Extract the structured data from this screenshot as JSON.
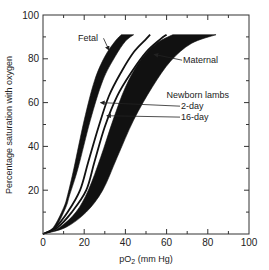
{
  "chart_data": {
    "type": "line",
    "title": "",
    "xlabel": "pO2 (mm Hg)",
    "xlabel_main": "pO",
    "xlabel_sub": "2",
    "xlabel_unit": " (mm Hg)",
    "ylabel": "Percentage saturation with oxygen",
    "xlim": [
      0,
      100
    ],
    "ylim": [
      0,
      100
    ],
    "x_ticks": [
      0,
      20,
      40,
      60,
      80,
      100
    ],
    "x_tick_labels": [
      "0",
      "20",
      "40",
      "60",
      "80",
      "100"
    ],
    "y_ticks": [
      0,
      20,
      40,
      60,
      80,
      100
    ],
    "y_tick_labels": [
      "",
      "20",
      "40",
      "60",
      "80",
      "100"
    ],
    "origin_label": "0",
    "minor_ticks": true,
    "grid": false,
    "legend": "inline annotations with arrows",
    "series": [
      {
        "name": "Fetal",
        "style": "filled band",
        "lower_edge": {
          "x": [
            0,
            5,
            10,
            12,
            15,
            20,
            25,
            30,
            35,
            38
          ],
          "y": [
            0,
            3,
            12,
            18,
            30,
            52,
            70,
            81,
            88,
            91
          ]
        },
        "upper_edge": {
          "x": [
            0,
            6,
            11,
            13,
            17,
            23,
            29,
            35,
            40,
            44
          ],
          "y": [
            0,
            3,
            12,
            18,
            30,
            52,
            70,
            81,
            88,
            91
          ]
        }
      },
      {
        "name": "Newborn lambs 2-day",
        "style": "line",
        "x": [
          0,
          6,
          12,
          18,
          22,
          27,
          32,
          38,
          44,
          50,
          52
        ],
        "y": [
          0,
          3,
          10,
          20,
          33,
          49,
          63,
          74,
          83,
          89,
          91
        ]
      },
      {
        "name": "Newborn lambs 16-day",
        "style": "line",
        "x": [
          0,
          7,
          14,
          21,
          25,
          30,
          36,
          43,
          50,
          57,
          60
        ],
        "y": [
          0,
          3,
          10,
          20,
          33,
          49,
          63,
          74,
          83,
          89,
          91
        ]
      },
      {
        "name": "Maternal",
        "style": "filled band",
        "lower_edge": {
          "x": [
            0,
            8,
            16,
            22,
            28,
            34,
            40,
            47,
            55,
            63
          ],
          "y": [
            0,
            3,
            10,
            20,
            35,
            52,
            67,
            79,
            87,
            91
          ]
        },
        "upper_edge": {
          "x": [
            0,
            11,
            21,
            29,
            36,
            44,
            53,
            62,
            72,
            84
          ],
          "y": [
            0,
            3,
            10,
            20,
            35,
            52,
            67,
            79,
            87,
            91
          ]
        }
      }
    ],
    "annotations": [
      {
        "text": "Fetal",
        "text_xy": [
          17,
          88
        ],
        "arrow_to": [
          32,
          84
        ]
      },
      {
        "text": "Maternal",
        "text_xy": [
          68,
          78
        ],
        "arrow_to": [
          54,
          82
        ]
      },
      {
        "text": "Newborn lambs",
        "text_xy": [
          60,
          62
        ]
      },
      {
        "text": "2-day",
        "text_xy": [
          67,
          57
        ],
        "arrow_to": [
          28,
          60
        ]
      },
      {
        "text": "16-day",
        "text_xy": [
          67,
          52
        ],
        "arrow_to": [
          31,
          54
        ]
      }
    ]
  }
}
